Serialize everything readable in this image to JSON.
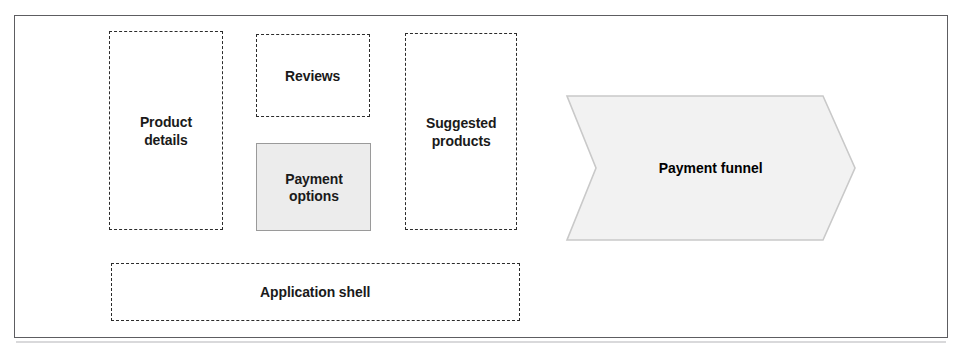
{
  "diagram": {
    "frame": {
      "border_color": "#5d5d61"
    },
    "boxes": [
      {
        "id": "product-details",
        "label": "Product\ndetails",
        "style": "dashed",
        "border_color": "#2b2b2b",
        "fill": "none"
      },
      {
        "id": "reviews",
        "label": "Reviews",
        "style": "dashed",
        "border_color": "#2b2b2b",
        "fill": "none"
      },
      {
        "id": "payment-options",
        "label": "Payment\noptions",
        "style": "solid",
        "border_color": "#9a9a9a",
        "fill": "#ececec"
      },
      {
        "id": "suggested-products",
        "label": "Suggested\nproducts",
        "style": "dashed",
        "border_color": "#2b2b2b",
        "fill": "none"
      },
      {
        "id": "application-shell",
        "label": "Application shell",
        "style": "dashed",
        "border_color": "#2b2b2b",
        "fill": "none"
      }
    ],
    "funnel": {
      "id": "payment-funnel",
      "label": "Payment funnel",
      "shape": "chevron-arrow-right",
      "fill": "#f2f2f2",
      "border_color": "#c9c9c9"
    }
  }
}
